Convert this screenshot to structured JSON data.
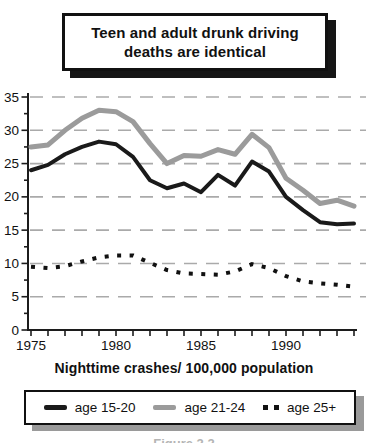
{
  "title_box": {
    "title": "Teen and adult drunk driving deaths are identical"
  },
  "axis_title": "Nighttime crashes/ 100,000 population",
  "legend": {
    "items": [
      {
        "label": "age 15-20",
        "swatch": "solid-black-line",
        "color": "#1a1a1a"
      },
      {
        "label": "age 21-24",
        "swatch": "solid-gray-line",
        "color": "#9b9b9b"
      },
      {
        "label": "age 25+",
        "swatch": "dotted-black-line",
        "color": "#111111"
      }
    ]
  },
  "footer": {
    "partial_caption": "Figure 2.2"
  },
  "colors": {
    "background": "#ffffff",
    "axis": "#1c1c1c",
    "gridline": "#aaaaaa",
    "box_shadow_dark": "#161616",
    "box_shadow_gray": "#9a9a9a"
  },
  "chart_data": {
    "type": "line",
    "title": "Teen and adult drunk driving deaths are identical",
    "xlabel": "Nighttime crashes/ 100,000 population",
    "ylabel": "",
    "ylim": [
      0,
      35
    ],
    "y_tick_step": 5,
    "y_minor_tick_step": 2.5,
    "grid": "horizontal dashed at every 5 units",
    "legend_position": "bottom",
    "x": [
      1975,
      1976,
      1977,
      1978,
      1979,
      1980,
      1981,
      1982,
      1983,
      1984,
      1985,
      1986,
      1987,
      1988,
      1989,
      1990,
      1991,
      1992,
      1993,
      1994
    ],
    "x_tick_labels": [
      1975,
      1980,
      1985,
      1990
    ],
    "y_tick_labels": [
      0,
      5,
      10,
      15,
      20,
      25,
      30,
      35
    ],
    "series": [
      {
        "name": "age 21-24",
        "style": "solid",
        "color": "#9b9b9b",
        "width": 5,
        "values": [
          27.5,
          27.8,
          30.0,
          31.8,
          33.0,
          32.8,
          31.3,
          28.0,
          25.0,
          26.2,
          26.1,
          27.1,
          26.4,
          29.4,
          27.4,
          22.8,
          21.0,
          19.0,
          19.5,
          18.6
        ]
      },
      {
        "name": "age 15-20",
        "style": "solid",
        "color": "#1a1a1a",
        "width": 4,
        "values": [
          24.0,
          24.8,
          26.4,
          27.5,
          28.3,
          27.9,
          26.0,
          22.5,
          21.3,
          22.0,
          20.7,
          23.3,
          21.7,
          25.3,
          23.8,
          20.0,
          18.0,
          16.2,
          15.9,
          16.0
        ]
      },
      {
        "name": "age 25+",
        "style": "dotted",
        "color": "#111111",
        "width": 4,
        "values": [
          9.5,
          9.3,
          9.6,
          10.3,
          10.9,
          11.2,
          11.2,
          10.1,
          9.0,
          8.5,
          8.4,
          8.3,
          8.8,
          9.9,
          9.3,
          8.1,
          7.3,
          7.0,
          6.8,
          6.5
        ]
      }
    ]
  }
}
